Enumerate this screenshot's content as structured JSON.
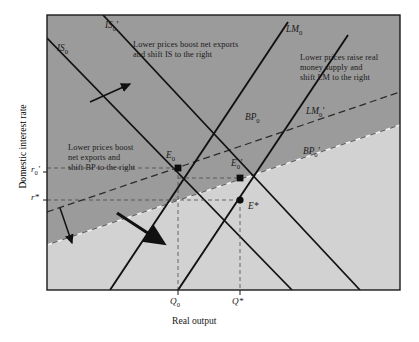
{
  "figure": {
    "axes": {
      "ylabel": "Domestic interest rate",
      "xlabel": "Real output",
      "yticks": [
        {
          "name": "r0prime",
          "label": "r",
          "sub": "0",
          "prime": "′",
          "y": 172
        },
        {
          "name": "rstar",
          "label": "r",
          "sub": "",
          "prime": "*",
          "y": 200
        }
      ],
      "xticks": [
        {
          "name": "Q0",
          "label": "Q",
          "sub": "0",
          "prime": "",
          "x": 178
        },
        {
          "name": "Qstar",
          "label": "Q",
          "sub": "",
          "prime": "*",
          "x": 240
        }
      ]
    },
    "curves": [
      {
        "name": "IS0",
        "label": "IS",
        "sub": "0",
        "prime": ""
      },
      {
        "name": "IS0prime",
        "label": "IS",
        "sub": "0",
        "prime": "′"
      },
      {
        "name": "LM0",
        "label": "LM",
        "sub": "0",
        "prime": ""
      },
      {
        "name": "LM0prime",
        "label": "LM",
        "sub": "0",
        "prime": "′"
      },
      {
        "name": "BP0",
        "label": "BP",
        "sub": "0",
        "prime": ""
      },
      {
        "name": "BP0prime",
        "label": "BP",
        "sub": "0",
        "prime": "′"
      }
    ],
    "equilibria": [
      {
        "name": "E0",
        "label": "E",
        "sub": "0",
        "prime": ""
      },
      {
        "name": "E0prime",
        "label": "E",
        "sub": "0",
        "prime": "′"
      },
      {
        "name": "Estar",
        "label": "E",
        "sub": "",
        "prime": "*"
      }
    ],
    "annotations": {
      "is_shift": {
        "line1": "Lower prices boost net exports",
        "line2": "and shift IS to the right"
      },
      "lm_shift": {
        "line1": "Lower prices raise real",
        "line2": "money supply and",
        "line3": "shift LM to the right"
      },
      "bp_shift": {
        "line1": "Lower prices boost",
        "line2": "net exports and",
        "line3": "shift BP to the right"
      }
    },
    "colors": {
      "plot_dark": "#9b9b9b",
      "plot_light": "#d2d2d2",
      "frame": "#1a1a1a",
      "curve": "#111111",
      "text": "#1a1a1a"
    }
  }
}
